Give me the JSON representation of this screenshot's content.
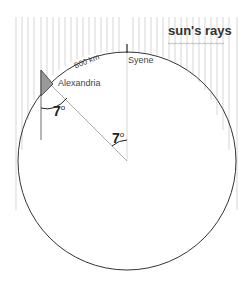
{
  "diagram": {
    "labels": {
      "suns_rays": "sun's rays",
      "syene": "Syene",
      "alexandria": "Alexandria",
      "distance": "800 km",
      "angle_shadow": "7",
      "angle_center": "7",
      "degree_symbol": "o"
    },
    "colors": {
      "outline": "#333333",
      "rays": "#bbbbbb",
      "shadow": "#999999"
    }
  }
}
